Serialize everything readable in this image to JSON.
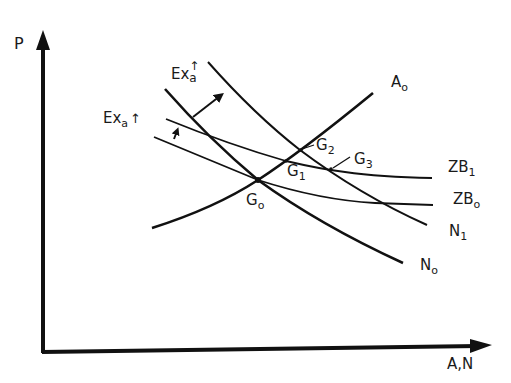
{
  "axes": {
    "y_label": "P",
    "x_label": "A,N"
  },
  "curves": [
    {
      "id": "A0",
      "label": "A",
      "sub": "o",
      "type": "upward"
    },
    {
      "id": "N0",
      "label": "N",
      "sub": "o",
      "type": "downward-steep"
    },
    {
      "id": "N1",
      "label": "N",
      "sub": "1",
      "type": "downward-steep"
    },
    {
      "id": "ZB0",
      "label": "ZB",
      "sub": "o",
      "type": "downward-flat"
    },
    {
      "id": "ZB1",
      "label": "ZB",
      "sub": "1",
      "type": "downward-flat"
    }
  ],
  "labels": {
    "A0": {
      "main": "A",
      "sub": "o"
    },
    "N0": {
      "main": "N",
      "sub": "o"
    },
    "N1": {
      "main": "N",
      "sub": "1"
    },
    "ZB0": {
      "main": "ZB",
      "sub": "o"
    },
    "ZB1": {
      "main": "ZB",
      "sub": "1"
    },
    "G0": {
      "main": "G",
      "sub": "o"
    },
    "G1": {
      "main": "G",
      "sub": "1"
    },
    "G2": {
      "main": "G",
      "sub": "2"
    },
    "G3": {
      "main": "G",
      "sub": "3"
    },
    "shift_zb": {
      "main": "Ex",
      "sub": "a",
      "arrow": "↑"
    },
    "shift_n": {
      "main": "Ex",
      "sub": "a",
      "arrow": "↑"
    }
  },
  "equilibria": [
    "G0",
    "G1",
    "G2",
    "G3"
  ],
  "colors": {
    "line": "#111111",
    "background": "#ffffff"
  }
}
